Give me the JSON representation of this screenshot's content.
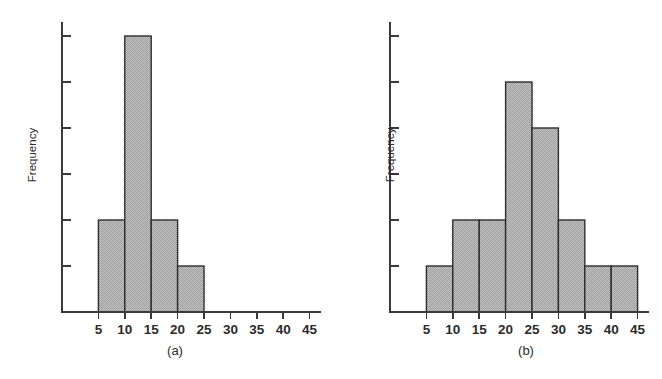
{
  "figure": {
    "background_color": "#ffffff",
    "bar_fill_color": "#b3b3b3",
    "bar_edge_color": "#2e2e2e",
    "axis_color": "#3a3a3a"
  },
  "panels": [
    {
      "id": "a",
      "caption": "(a)",
      "ylabel": "Frequency",
      "xlabel": "",
      "x_tick_labels": [
        "5",
        "10",
        "15",
        "20",
        "25",
        "30",
        "35",
        "40",
        "45"
      ]
    },
    {
      "id": "b",
      "caption": "(b)",
      "ylabel": "Frequency",
      "xlabel": "",
      "x_tick_labels": [
        "5",
        "10",
        "15",
        "20",
        "25",
        "30",
        "35",
        "40",
        "45"
      ]
    }
  ],
  "chart_data": [
    {
      "type": "bar",
      "title": "(a)",
      "subtitle": "",
      "xlabel": "",
      "ylabel": "Frequency",
      "bin_edges": [
        5,
        10,
        15,
        20,
        25
      ],
      "categories": [
        "5-10",
        "10-15",
        "15-20",
        "20-25"
      ],
      "values": [
        2,
        6,
        2,
        1
      ],
      "xlim": [
        0,
        47.5
      ],
      "ylim": [
        0,
        6.5
      ],
      "x_ticks": [
        5,
        10,
        15,
        20,
        25,
        30,
        35,
        40,
        45
      ],
      "x_tick_labels": [
        "5",
        "10",
        "15",
        "20",
        "25",
        "30",
        "35",
        "40",
        "45"
      ],
      "y_ticks": [
        1,
        2,
        3,
        4,
        5,
        6
      ],
      "y_tick_labels": [
        "",
        "",
        "",
        "",
        "",
        ""
      ],
      "grid": false,
      "legend": false,
      "legend_position": "none",
      "annotations": [
        "(a)"
      ]
    },
    {
      "type": "bar",
      "title": "(b)",
      "subtitle": "",
      "xlabel": "",
      "ylabel": "Frequency",
      "bin_edges": [
        5,
        10,
        15,
        20,
        25,
        30,
        35,
        40,
        45
      ],
      "categories": [
        "5-10",
        "10-15",
        "15-20",
        "20-25",
        "25-30",
        "30-35",
        "35-40",
        "40-45"
      ],
      "values": [
        1,
        2,
        2,
        5,
        4,
        2,
        1,
        1
      ],
      "xlim": [
        0,
        47.5
      ],
      "ylim": [
        0,
        6.5
      ],
      "x_ticks": [
        5,
        10,
        15,
        20,
        25,
        30,
        35,
        40,
        45
      ],
      "x_tick_labels": [
        "5",
        "10",
        "15",
        "20",
        "25",
        "30",
        "35",
        "40",
        "45"
      ],
      "y_ticks": [
        1,
        2,
        3,
        4,
        5,
        6
      ],
      "y_tick_labels": [
        "",
        "",
        "",
        "",
        "",
        ""
      ],
      "grid": false,
      "legend": false,
      "legend_position": "none",
      "annotations": [
        "(b)"
      ]
    }
  ]
}
